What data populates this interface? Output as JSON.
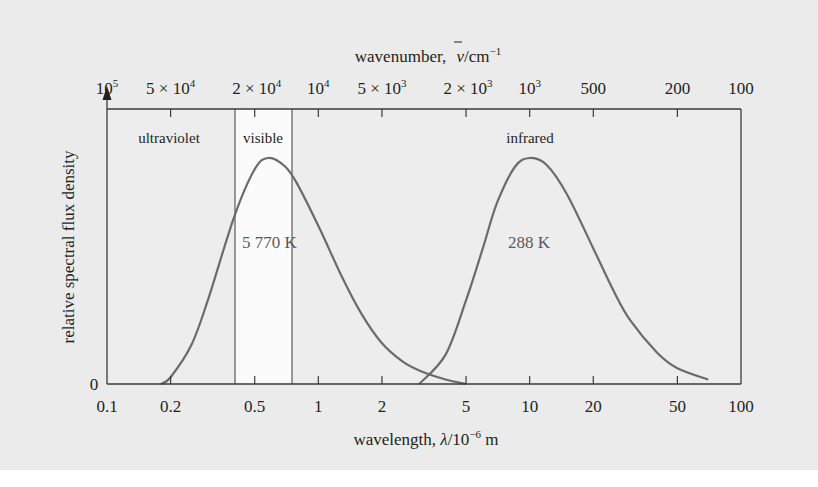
{
  "chart_data": {
    "type": "line",
    "title": "",
    "xlabel": "wavelength, λ/10⁻⁶ m",
    "xlabel_parts": {
      "prefix": "wavelength, ",
      "symbol": "λ",
      "unit": "/10",
      "exp": "−6",
      "suffix": " m"
    },
    "ylabel": "relative spectral flux density",
    "x_scale": "log",
    "xlim": [
      0.1,
      100
    ],
    "ylim": [
      0,
      1.15
    ],
    "y_tick_labels": [
      "0"
    ],
    "x_ticks": [
      0.1,
      0.2,
      0.5,
      1,
      2,
      5,
      10,
      20,
      50,
      100
    ],
    "x_tick_labels": [
      "0.1",
      "0.2",
      "0.5",
      "1",
      "2",
      "5",
      "10",
      "20",
      "50",
      "100"
    ],
    "top_axis": {
      "label": "wavenumber, ν̄/cm⁻¹",
      "label_parts": {
        "prefix": "wavenumber, ",
        "symbol": "ν",
        "unit": "/cm",
        "exp": "−1"
      },
      "ticks_wavelength_um": [
        0.1,
        0.2,
        0.5,
        1,
        2,
        5,
        10,
        20,
        50,
        100
      ],
      "tick_labels": [
        {
          "base": "10",
          "exp": "5"
        },
        {
          "base": "5 × 10",
          "exp": "4"
        },
        {
          "base": "2 × 10",
          "exp": "4"
        },
        {
          "base": "10",
          "exp": "4"
        },
        {
          "base": "5 × 10",
          "exp": "3"
        },
        {
          "base": "2 × 10",
          "exp": "3"
        },
        {
          "base": "10",
          "exp": "3"
        },
        {
          "base": "500",
          "exp": ""
        },
        {
          "base": "200",
          "exp": ""
        },
        {
          "base": "100",
          "exp": ""
        }
      ]
    },
    "regions": [
      {
        "name": "ultraviolet",
        "x_range": [
          0.1,
          0.4
        ]
      },
      {
        "name": "visible",
        "x_range": [
          0.4,
          0.75
        ]
      },
      {
        "name": "infrared",
        "x_range": [
          0.75,
          100
        ]
      }
    ],
    "series": [
      {
        "name": "5 770 K",
        "label": "5 770 K",
        "x": [
          0.18,
          0.2,
          0.25,
          0.3,
          0.4,
          0.5,
          0.58,
          0.7,
          0.8,
          1.0,
          1.3,
          1.6,
          2.0,
          2.5,
          3.0,
          4.0,
          5.0
        ],
        "values": [
          0.0,
          0.03,
          0.17,
          0.37,
          0.74,
          0.95,
          1.0,
          0.96,
          0.88,
          0.7,
          0.47,
          0.31,
          0.18,
          0.1,
          0.06,
          0.02,
          0.0
        ]
      },
      {
        "name": "288 K",
        "label": "288 K",
        "x": [
          3.0,
          4.0,
          5.0,
          6.0,
          7.0,
          8.5,
          10.0,
          12.0,
          15.0,
          20.0,
          25.0,
          30.0,
          40.0,
          50.0,
          70.0
        ],
        "values": [
          0.0,
          0.13,
          0.37,
          0.6,
          0.8,
          0.96,
          1.0,
          0.97,
          0.84,
          0.6,
          0.41,
          0.28,
          0.14,
          0.07,
          0.02
        ]
      }
    ],
    "grid": false,
    "legend": "none (curves labelled inline)"
  },
  "labels": {
    "region_ultraviolet": "ultraviolet",
    "region_visible": "visible",
    "region_infrared": "infrared",
    "curve_sun": "5 770 K",
    "curve_earth": "288 K",
    "y_zero": "0",
    "y_axis_title": "relative spectral flux density"
  },
  "colors": {
    "background": "#ebebeb",
    "plot_area": "#ededed",
    "visible_band": "#fbfbfb",
    "axes": "#3a3a3a",
    "curve": "#6b6b6b",
    "text": "#231f20"
  }
}
